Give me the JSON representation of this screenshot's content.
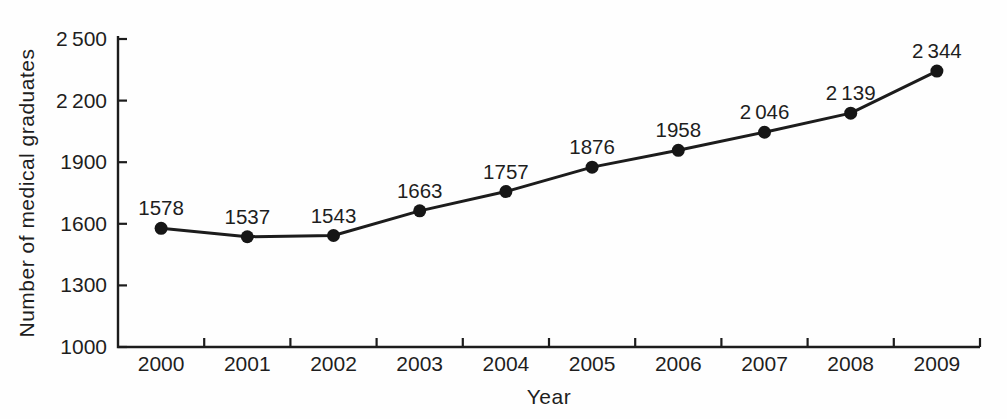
{
  "chart_data": {
    "type": "line",
    "title": "",
    "xlabel": "Year",
    "ylabel": "Number of medical graduates",
    "categories": [
      "2000",
      "2001",
      "2002",
      "2003",
      "2004",
      "2005",
      "2006",
      "2007",
      "2008",
      "2009"
    ],
    "series": [
      {
        "name": "Number of medical graduates",
        "values": [
          1578,
          1537,
          1543,
          1663,
          1757,
          1876,
          1958,
          2046,
          2139,
          2344
        ],
        "point_labels": [
          "1578",
          "1537",
          "1543",
          "1663",
          "1757",
          "1876",
          "1958",
          "2 046",
          "2 139",
          "2 344"
        ]
      }
    ],
    "ylim": [
      1000,
      2500
    ],
    "ytick_step": 300,
    "ytick_labels": [
      "1000",
      "1300",
      "1600",
      "1900",
      "2 200",
      "2 500"
    ],
    "grid": false,
    "legend_position": "none",
    "line_color": "#1c1c1c",
    "marker": "circle",
    "marker_color": "#161616",
    "axis_color": "#1c1c1c"
  }
}
